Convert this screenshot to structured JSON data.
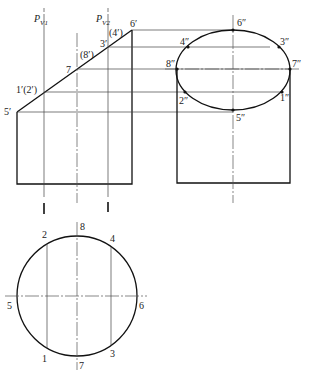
{
  "diagram": {
    "type": "orthographic-projection",
    "front_view": {
      "cutting_planes": [
        {
          "label": "P",
          "subscript": "V1"
        },
        {
          "label": "P",
          "subscript": "V2"
        }
      ],
      "points": [
        {
          "id": "5p",
          "label": "5′"
        },
        {
          "id": "1p",
          "label": "1′(2′)"
        },
        {
          "id": "7p",
          "label": "7"
        },
        {
          "id": "8p",
          "label": "(8′)"
        },
        {
          "id": "3p",
          "label": "3′"
        },
        {
          "id": "4p",
          "label": "(4′)"
        },
        {
          "id": "6p",
          "label": "6′"
        }
      ]
    },
    "side_view": {
      "points": [
        {
          "id": "6pp",
          "label": "6″"
        },
        {
          "id": "4pp",
          "label": "4″"
        },
        {
          "id": "3pp",
          "label": "3″"
        },
        {
          "id": "8pp",
          "label": "8″"
        },
        {
          "id": "7pp",
          "label": "7″"
        },
        {
          "id": "2pp",
          "label": "2″"
        },
        {
          "id": "1pp",
          "label": "1″"
        },
        {
          "id": "5pp",
          "label": "5″"
        }
      ]
    },
    "top_view": {
      "points": [
        {
          "id": "8",
          "label": "8"
        },
        {
          "id": "2",
          "label": "2"
        },
        {
          "id": "4",
          "label": "4"
        },
        {
          "id": "5",
          "label": "5"
        },
        {
          "id": "6",
          "label": "6"
        },
        {
          "id": "1",
          "label": "1"
        },
        {
          "id": "3",
          "label": "3"
        },
        {
          "id": "7",
          "label": "7"
        }
      ]
    }
  }
}
